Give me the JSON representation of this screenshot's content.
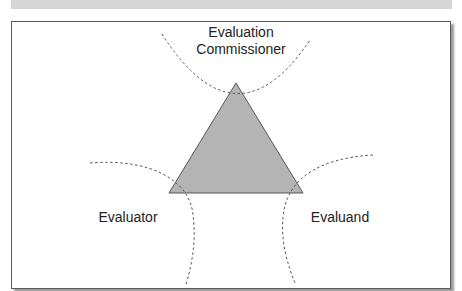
{
  "diagram": {
    "type": "stakeholder-triangle",
    "colors": {
      "triangle_fill": "#b4b4b4",
      "triangle_stroke": "#555555",
      "dashed_curves": "#555555",
      "frame_border": "#5a5a5a",
      "top_band": "#d6d6d6"
    },
    "nodes": [
      {
        "id": "commissioner",
        "label_line1": "Evaluation",
        "label_line2": "Commissioner",
        "position": "top"
      },
      {
        "id": "evaluator",
        "label": "Evaluator",
        "position": "bottom-left"
      },
      {
        "id": "evaluand",
        "label": "Evaluand",
        "position": "bottom-right"
      }
    ],
    "triangle": {
      "apex": [
        236,
        83
      ],
      "left": [
        169,
        193
      ],
      "right": [
        303,
        193
      ]
    }
  }
}
